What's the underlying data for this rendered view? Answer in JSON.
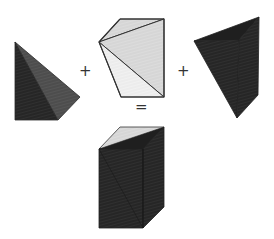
{
  "diagram": {
    "operators": {
      "plus1": "+",
      "plus2": "+",
      "equals": "="
    },
    "colors": {
      "dark": "#2b2b2b",
      "dark_face": "#242424",
      "medium": "#555555",
      "light": "#d9d9d9",
      "lighter": "#e6e6e6",
      "lightest": "#efefef",
      "edge": "#333333",
      "background": "#ffffff"
    },
    "shapes": [
      {
        "name": "tetrahedron-left",
        "role": "term 1"
      },
      {
        "name": "tetrahedron-middle",
        "role": "term 2"
      },
      {
        "name": "tetrahedron-right",
        "role": "term 3"
      },
      {
        "name": "triangular-prism",
        "role": "result"
      }
    ]
  }
}
